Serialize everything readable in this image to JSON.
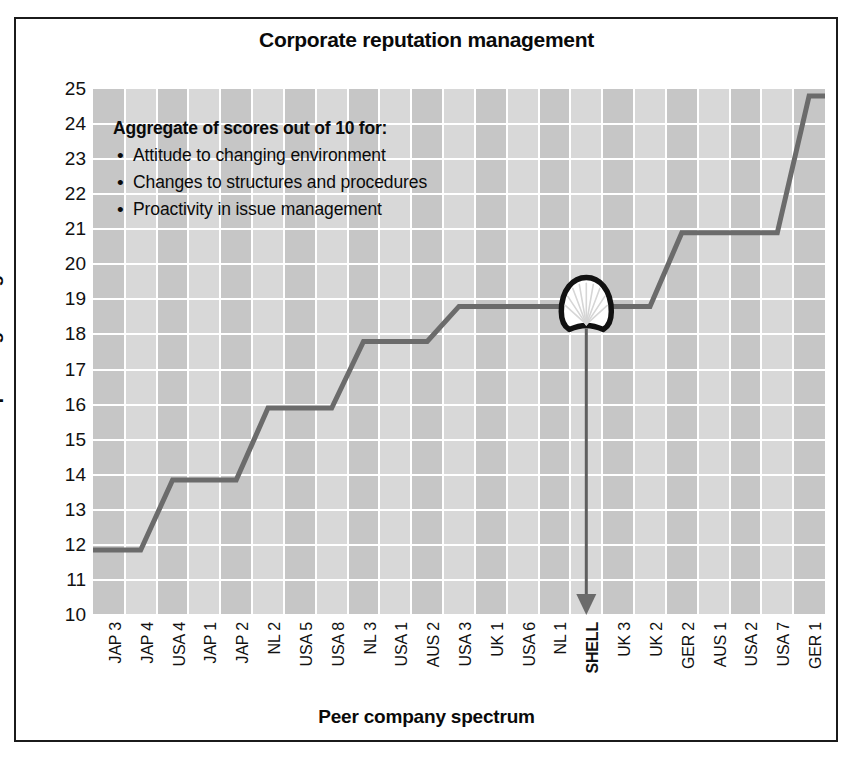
{
  "chart_data": {
    "type": "line",
    "title": "Corporate reputation management",
    "xlabel": "Peer company spectrum",
    "ylabel": "Composite grading",
    "ylim": [
      10,
      25
    ],
    "yticks": [
      10,
      11,
      12,
      13,
      14,
      15,
      16,
      17,
      18,
      19,
      20,
      21,
      22,
      23,
      24,
      25
    ],
    "grid": true,
    "legend": "none",
    "categories": [
      "JAP 3",
      "JAP 4",
      "USA 4",
      "JAP 1",
      "JAP 2",
      "NL 2",
      "USA 5",
      "USA 8",
      "NL 3",
      "USA 1",
      "AUS 2",
      "USA 3",
      "UK 1",
      "USA 6",
      "NL 1",
      "SHELL",
      "UK 3",
      "UK 2",
      "GER 2",
      "AUS 1",
      "USA 2",
      "USA 7",
      "GER 1"
    ],
    "values": [
      11.85,
      11.85,
      13.85,
      13.85,
      13.85,
      15.9,
      15.9,
      15.9,
      17.8,
      17.8,
      17.8,
      18.8,
      18.8,
      18.8,
      18.8,
      18.8,
      18.8,
      18.8,
      20.9,
      20.9,
      20.9,
      20.9,
      24.8
    ],
    "series": [
      {
        "name": "Composite grading",
        "values": [
          11.85,
          11.85,
          13.85,
          13.85,
          13.85,
          15.9,
          15.9,
          15.9,
          17.8,
          17.8,
          17.8,
          18.8,
          18.8,
          18.8,
          18.8,
          18.8,
          18.8,
          18.8,
          20.9,
          20.9,
          20.9,
          20.9,
          24.8
        ]
      }
    ],
    "annotations": [
      {
        "name": "shell-marker",
        "category": "SHELL",
        "value": 18.8,
        "label": "SHELL",
        "marker": "shell-pecten-logo"
      },
      {
        "name": "shell-pointer-arrow",
        "from_category": "SHELL",
        "direction": "down",
        "target": "SHELL axis label"
      }
    ],
    "line_color": "#6b6b6b",
    "plot_background": "#cdcdcd",
    "gridline_color": "#ffffff"
  },
  "annotation_box": {
    "heading": "Aggregate of scores out of 10 for:",
    "bullets": [
      "Attitude to changing environment",
      "Changes to structures and procedures",
      "Proactivity in issue management"
    ]
  },
  "colors": {
    "frame": "#1b1b1b",
    "text": "#0a0a0a",
    "line": "#6b6b6b",
    "band_dark": "#c6c6c6",
    "band_light": "#d8d8d8"
  }
}
